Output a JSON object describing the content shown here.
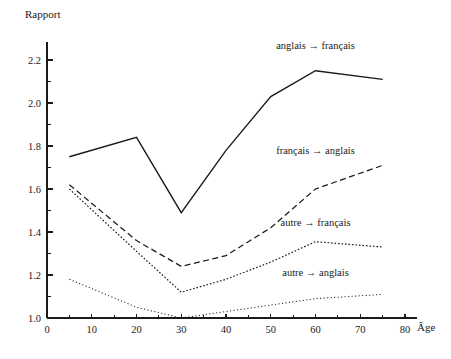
{
  "chart_data": {
    "type": "line",
    "title": "",
    "xlabel": "Âge",
    "ylabel": "Rapport",
    "xlim": [
      0,
      80
    ],
    "ylim": [
      1.0,
      2.2
    ],
    "grid": false,
    "legend_position": "inline-right",
    "x_major_ticks": [
      0,
      10,
      20,
      30,
      40,
      50,
      60,
      70,
      80
    ],
    "x_minor_ticks": [
      5,
      15,
      25,
      35,
      45,
      55,
      65,
      75
    ],
    "x_tick_labels": [
      "0",
      "10",
      "20",
      "30",
      "40",
      "50",
      "60",
      "70",
      "80"
    ],
    "y_major_ticks": [
      1.0,
      1.2,
      1.4,
      1.6,
      1.8,
      2.0,
      2.2
    ],
    "y_minor_ticks": [
      1.1,
      1.3,
      1.5,
      1.7,
      1.9,
      2.1
    ],
    "y_tick_labels": [
      "1.0",
      "1.2",
      "1.4",
      "1.6",
      "1.8",
      "2.0",
      "2.2"
    ],
    "x": [
      5,
      20,
      30,
      40,
      50,
      60,
      75
    ],
    "series": [
      {
        "name": "anglais → français",
        "style": "solid",
        "color": "#1a1a1a",
        "values": [
          1.75,
          1.84,
          1.49,
          1.78,
          2.03,
          2.15,
          2.11
        ],
        "label_x": 60,
        "label_y": 2.24
      },
      {
        "name": "français → anglais",
        "style": "dashed",
        "color": "#1a1a1a",
        "values": [
          1.62,
          1.36,
          1.24,
          1.29,
          1.42,
          1.6,
          1.71
        ],
        "label_x": 60,
        "label_y": 1.755
      },
      {
        "name": "autre → français",
        "style": "dotted",
        "color": "#1a1a1a",
        "values": [
          1.6,
          1.31,
          1.12,
          1.18,
          1.26,
          1.355,
          1.33
        ],
        "label_x": 60,
        "label_y": 1.42
      },
      {
        "name": "autre → anglais",
        "style": "fine-dotted",
        "color": "#1a1a1a",
        "values": [
          1.18,
          1.05,
          1.0,
          1.03,
          1.06,
          1.09,
          1.11
        ],
        "label_x": 60,
        "label_y": 1.185
      }
    ]
  },
  "axes": {
    "y_title": "Rapport",
    "x_title": "Âge"
  }
}
